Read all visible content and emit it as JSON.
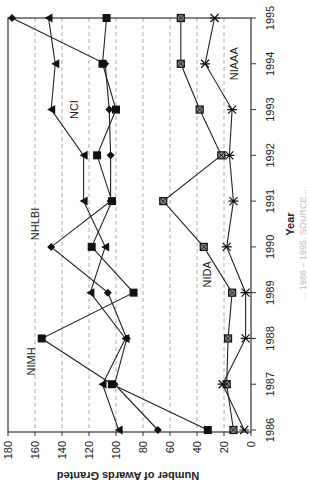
{
  "chart_data": {
    "type": "line",
    "orientation": "rotated 90 degrees clockwise (years run bottom-to-top on the right, values run right-to-left)",
    "title": "",
    "xlabel": "Year",
    "ylabel": "Number of Awards Granted",
    "x": [
      1986,
      1987,
      1988,
      1989,
      1990,
      1991,
      1992,
      1993,
      1994,
      1995
    ],
    "x_tick_labels": [
      "1986",
      "1987",
      "1988",
      "1989",
      "1990",
      "1991",
      "1992",
      "1993",
      "1994",
      "1995"
    ],
    "y_ticks": [
      0,
      20,
      40,
      60,
      80,
      100,
      120,
      140,
      160,
      180
    ],
    "y_tick_labels": [
      "0",
      "20",
      "40",
      "60",
      "80",
      "100",
      "120",
      "140",
      "160",
      "180"
    ],
    "ylim": [
      0,
      180
    ],
    "grid": "dashed lines at each y tick",
    "legend": "inline labels",
    "series": [
      {
        "name": "NCI",
        "marker": "triangle",
        "values": [
          98,
          110,
          93,
          119,
          108,
          124,
          124,
          148,
          145,
          150
        ]
      },
      {
        "name": "NHLBI",
        "marker": "diamond",
        "values": [
          69,
          101,
          92,
          106,
          148,
          104,
          104,
          105,
          108,
          177
        ]
      },
      {
        "name": "NIMH",
        "marker": "square",
        "values": [
          32,
          103,
          155,
          87,
          118,
          103,
          114,
          100,
          110,
          107
        ]
      },
      {
        "name": "NIDA",
        "marker": "boxed-x",
        "values": [
          13,
          18,
          17,
          14,
          35,
          65,
          22,
          38,
          52,
          52
        ]
      },
      {
        "name": "NIAAA",
        "marker": "asterisk",
        "values": [
          5,
          21,
          4,
          4,
          18,
          13,
          16,
          14,
          34,
          27
        ]
      }
    ],
    "annotations": [
      {
        "text": "NCI",
        "near_year": 1993,
        "near_value": 128
      },
      {
        "text": "NHLBI",
        "near_year": 1990.5,
        "near_value": 157
      },
      {
        "text": "NIMH",
        "near_year": 1987.5,
        "near_value": 160
      },
      {
        "text": "NIDA",
        "near_year": 1989.4,
        "near_value": 30
      },
      {
        "text": "NIAAA",
        "near_year": 1994,
        "near_value": 10
      }
    ]
  },
  "caption": "... 1986 – 1995. SOURCE ..."
}
